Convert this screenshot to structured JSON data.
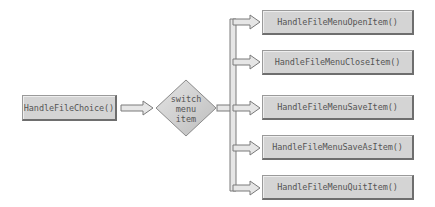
{
  "diagram": {
    "source": {
      "label": "HandleFileChoice()"
    },
    "decision": {
      "lines": [
        "switch",
        "menu",
        "item"
      ]
    },
    "targets": [
      {
        "label": "HandleFileMenuOpenItem()"
      },
      {
        "label": "HandleFileMenuCloseItem()"
      },
      {
        "label": "HandleFileMenuSaveItem()"
      },
      {
        "label": "HandleFileMenuSaveAsItem()"
      },
      {
        "label": "HandleFileMenuQuitItem()"
      }
    ],
    "colors": {
      "box_fill": "#d4d4d4",
      "box_border": "#6e6e6e",
      "arrow_fill": "#e6e6e6",
      "arrow_stroke": "#7a7a7a",
      "text": "#555555"
    }
  }
}
